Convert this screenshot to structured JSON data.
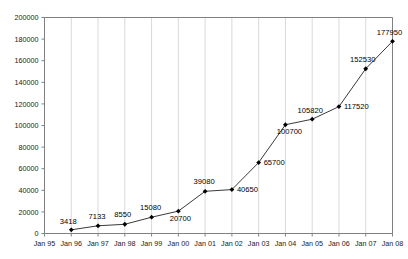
{
  "chart_data": {
    "type": "line",
    "title": "",
    "subtitle": "",
    "xlabel": "",
    "ylabel": "",
    "grid": "vertical",
    "legend": "none",
    "xlim": [
      "Jan 95",
      "Jan 08"
    ],
    "ylim": [
      0,
      200000
    ],
    "ytick_step": 20000,
    "x_tick_labels": [
      "Jan 95",
      "Jan 96",
      "Jan 97",
      "Jan 98",
      "Jan 99",
      "Jan 00",
      "Jan 01",
      "Jan 02",
      "Jan 03",
      "Jan 04",
      "Jan 05",
      "Jan 06",
      "Jan 07",
      "Jan 08"
    ],
    "y_tick_labels": [
      "0",
      "20000",
      "40000",
      "60000",
      "80000",
      "100000",
      "120000",
      "140000",
      "160000",
      "180000",
      "200000"
    ],
    "y_tick_values": [
      0,
      20000,
      40000,
      60000,
      80000,
      100000,
      120000,
      140000,
      160000,
      180000,
      200000
    ],
    "series": [
      {
        "name": "series-1",
        "x": [
          "Jan 96",
          "Jan 97",
          "Jan 98",
          "Jan 99",
          "Jan 00",
          "Jan 01",
          "Jan 02",
          "Jan 03",
          "Jan 04",
          "Jan 05",
          "Jan 06",
          "Jan 07",
          "Jan 08"
        ],
        "values": [
          3418,
          7133,
          8550,
          15080,
          20700,
          39080,
          40650,
          65700,
          100700,
          105820,
          117520,
          152530,
          177950
        ],
        "point_labels": [
          "3418",
          "7133",
          "8550",
          "15080",
          "20700",
          "39080",
          "40650",
          "65700",
          "100700",
          "105820",
          "117520",
          "152530",
          "177950"
        ],
        "line_color": "#3a3a3a",
        "marker_color": "#000000",
        "marker": "diamond"
      }
    ],
    "colors": {
      "plot_background": "#ffffff",
      "grid_color": "#d9d9d9",
      "axis_color": "#808080",
      "text_color": "#1a1a1a"
    }
  }
}
